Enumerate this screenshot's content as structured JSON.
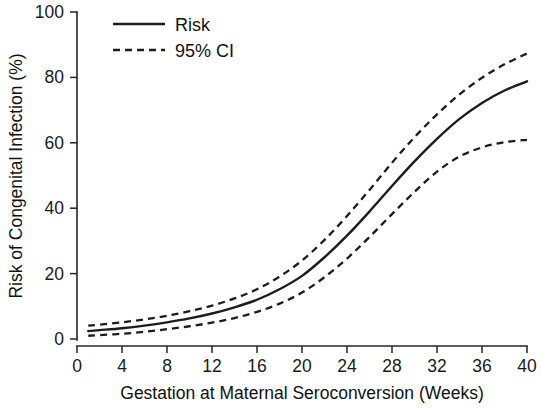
{
  "chart_data": {
    "type": "line",
    "title": "",
    "xlabel": "Gestation at Maternal Seroconversion (Weeks)",
    "ylabel": "Risk of Congenital Infection (%)",
    "xlim": [
      0,
      40
    ],
    "ylim": [
      0,
      100
    ],
    "xticks": [
      0,
      4,
      8,
      12,
      16,
      20,
      24,
      28,
      32,
      36,
      40
    ],
    "yticks": [
      0,
      20,
      40,
      60,
      80,
      100
    ],
    "xtick_labels": [
      "0",
      "4",
      "8",
      "12",
      "16",
      "20",
      "24",
      "28",
      "32",
      "36",
      "40"
    ],
    "ytick_labels": [
      "0",
      "20",
      "40",
      "60",
      "80",
      "100"
    ],
    "grid": false,
    "legend_position": "top-left",
    "legend": [
      {
        "name": "Risk",
        "style": "solid"
      },
      {
        "name": "95% CI",
        "style": "dashed"
      }
    ],
    "x": [
      1,
      2,
      4,
      6,
      8,
      10,
      12,
      14,
      16,
      18,
      20,
      22,
      24,
      26,
      28,
      30,
      32,
      34,
      36,
      38,
      40
    ],
    "series": [
      {
        "name": "Risk",
        "style": "solid",
        "color": "#1c1c1c",
        "values": [
          2.4,
          2.7,
          3.3,
          4.1,
          5.1,
          6.3,
          7.8,
          9.7,
          12.0,
          15.2,
          19.3,
          25.0,
          31.6,
          39.0,
          46.8,
          54.3,
          61.2,
          67.3,
          72.2,
          76.0,
          78.8
        ]
      },
      {
        "name": "95% CI upper",
        "style": "dashed",
        "color": "#1c1c1c",
        "values": [
          4.1,
          4.4,
          5.1,
          6.0,
          7.1,
          8.5,
          10.2,
          12.4,
          15.2,
          19.1,
          24.0,
          30.3,
          37.6,
          45.6,
          53.9,
          61.7,
          68.7,
          74.8,
          79.9,
          84.0,
          87.3
        ]
      },
      {
        "name": "95% CI lower",
        "style": "dashed",
        "color": "#1c1c1c",
        "values": [
          1.0,
          1.2,
          1.6,
          2.2,
          3.0,
          3.9,
          5.0,
          6.4,
          8.3,
          10.8,
          14.2,
          18.9,
          24.6,
          31.2,
          38.2,
          45.0,
          51.2,
          55.8,
          58.6,
          60.2,
          60.9
        ]
      }
    ]
  }
}
